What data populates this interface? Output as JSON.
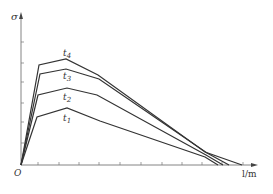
{
  "chart_data": {
    "type": "line",
    "title": "",
    "xlabel": "l/m",
    "ylabel": "σ",
    "origin_label": "O",
    "x_ticks_count": 11,
    "y_ticks_count": 6,
    "grid": false,
    "legend": "inline labels",
    "series": [
      {
        "name": "t1",
        "points": [
          [
            21,
            165
          ],
          [
            37,
            117
          ],
          [
            67,
            108
          ],
          [
            100,
            121
          ],
          [
            205,
            157
          ],
          [
            218,
            165
          ]
        ]
      },
      {
        "name": "t2",
        "points": [
          [
            21,
            165
          ],
          [
            38,
            95
          ],
          [
            67,
            88
          ],
          [
            97,
            95
          ],
          [
            206,
            155
          ],
          [
            223,
            165
          ]
        ]
      },
      {
        "name": "t3",
        "points": [
          [
            21,
            165
          ],
          [
            40,
            74
          ],
          [
            66,
            69
          ],
          [
            99,
            79
          ],
          [
            207,
            153
          ],
          [
            229,
            165
          ]
        ]
      },
      {
        "name": "t4",
        "points": [
          [
            21,
            165
          ],
          [
            39,
            65
          ],
          [
            66,
            59
          ],
          [
            98,
            75
          ],
          [
            205,
            152
          ],
          [
            242,
            165
          ]
        ]
      }
    ],
    "labels": [
      {
        "text": "t",
        "sub": "1",
        "x": 63,
        "y": 121
      },
      {
        "text": "t",
        "sub": "2",
        "x": 63,
        "y": 100
      },
      {
        "text": "t",
        "sub": "3",
        "x": 63,
        "y": 79
      },
      {
        "text": "t",
        "sub": "4",
        "x": 63,
        "y": 56
      }
    ],
    "axes": {
      "origin": [
        21,
        165
      ],
      "x_end": 258,
      "y_top": 12,
      "x_ticks": [
        38,
        59,
        79,
        99,
        120,
        141,
        162,
        182,
        202,
        222,
        243
      ],
      "y_ticks": [
        42,
        63,
        82,
        103,
        122,
        143
      ]
    },
    "line_color": "#333333"
  }
}
